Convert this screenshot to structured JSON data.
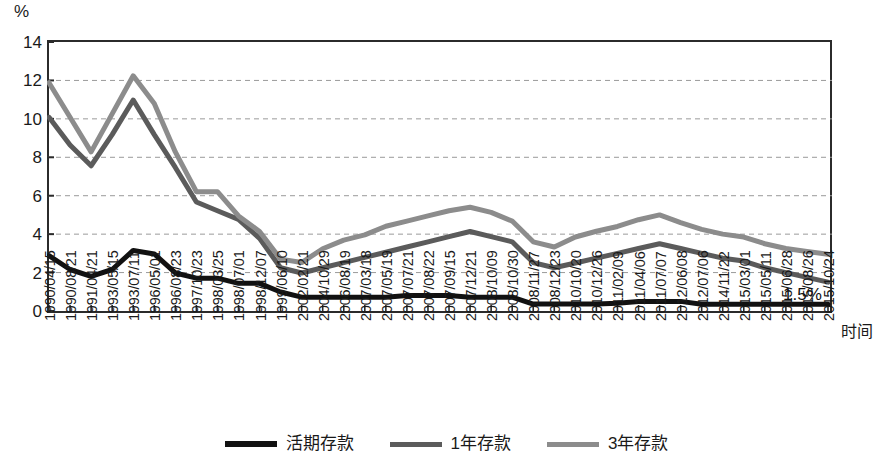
{
  "chart_data": {
    "type": "line",
    "title": "",
    "xlabel": "时间",
    "ylabel": "%",
    "ylim": [
      0,
      14
    ],
    "ytick_values": [
      0,
      2,
      4,
      6,
      8,
      10,
      12,
      14
    ],
    "ytick_labels": [
      "0",
      "2",
      "4",
      "6",
      "8",
      "10",
      "12",
      "14"
    ],
    "grid": "horizontal-dashed",
    "legend_position": "bottom-center",
    "categories": [
      "1990/04/15",
      "1990/08/21",
      "1991/04/21",
      "1993/05/15",
      "1993/07/11",
      "1996/05/01",
      "1996/08/23",
      "1997/10/23",
      "1998/03/25",
      "1998/07/01",
      "1998/12/07",
      "1999/06/10",
      "2002/02/21",
      "2004/10/29",
      "2006/08/19",
      "2007/03/18",
      "2007/05/19",
      "2007/07/21",
      "2007/08/22",
      "2007/09/15",
      "2007/12/21",
      "2008/10/09",
      "2008/10/30",
      "2008/11/27",
      "2008/12/23",
      "2010/10/20",
      "2010/12/26",
      "2011/02/09",
      "2011/04/06",
      "2011/07/07",
      "2012/06/08",
      "2012/07/06",
      "2014/11/22",
      "2015/03/01",
      "2015/05/11",
      "2015/06/28",
      "2015/08/26",
      "2015/10/24"
    ],
    "series": [
      {
        "name": "活期存款",
        "color": "#111111",
        "width": 5,
        "values": [
          2.88,
          2.16,
          1.8,
          2.16,
          3.15,
          2.97,
          1.98,
          1.71,
          1.71,
          1.44,
          1.44,
          0.99,
          0.72,
          0.72,
          0.72,
          0.72,
          0.72,
          0.81,
          0.81,
          0.81,
          0.72,
          0.72,
          0.72,
          0.36,
          0.36,
          0.36,
          0.36,
          0.4,
          0.5,
          0.5,
          0.5,
          0.35,
          0.35,
          0.35,
          0.35,
          0.35,
          0.35,
          0.35
        ]
      },
      {
        "name": "1年存款",
        "color": "#5b5b5b",
        "width": 5,
        "values": [
          10.08,
          8.64,
          7.56,
          9.18,
          10.98,
          9.18,
          7.47,
          5.67,
          5.22,
          4.77,
          3.78,
          2.25,
          1.98,
          2.25,
          2.52,
          2.79,
          3.06,
          3.33,
          3.6,
          3.87,
          4.14,
          3.87,
          3.6,
          2.52,
          2.25,
          2.5,
          2.75,
          3.0,
          3.25,
          3.5,
          3.25,
          3.0,
          2.75,
          2.6,
          2.25,
          2.0,
          1.75,
          1.5
        ]
      },
      {
        "name": "3年存款",
        "color": "#8c8c8c",
        "width": 5,
        "values": [
          11.88,
          10.08,
          8.28,
          10.26,
          12.24,
          10.8,
          8.28,
          6.21,
          6.21,
          4.95,
          4.14,
          2.7,
          2.52,
          3.24,
          3.69,
          3.96,
          4.41,
          4.68,
          4.95,
          5.22,
          5.4,
          5.13,
          4.68,
          3.6,
          3.33,
          3.85,
          4.15,
          4.4,
          4.75,
          5.0,
          4.6,
          4.25,
          4.0,
          3.85,
          3.5,
          3.25,
          3.1,
          2.95
        ]
      }
    ],
    "annotations": [
      {
        "text": "1.5%",
        "x_index": 36,
        "y_value": 1.5
      }
    ]
  },
  "axis": {
    "y_unit_label": "%",
    "x_title": "时间"
  },
  "legend": {
    "items": [
      {
        "label": "活期存款",
        "color": "#111111"
      },
      {
        "label": "1年存款",
        "color": "#5b5b5b"
      },
      {
        "label": "3年存款",
        "color": "#8c8c8c"
      }
    ]
  }
}
